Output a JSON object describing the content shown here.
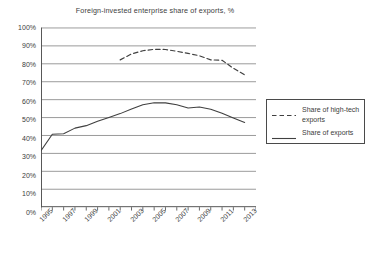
{
  "chart_data": {
    "type": "line",
    "title": "Foreign-invested enterprise share of exports, %",
    "xlabel": "",
    "ylabel": "",
    "ylim": [
      0,
      100
    ],
    "xlim": [
      1995,
      2014
    ],
    "grid": "horizontal",
    "legend_position": "right",
    "y_ticks": [
      "0%",
      "10%",
      "20%",
      "30%",
      "40%",
      "50%",
      "60%",
      "70%",
      "80%",
      "90%",
      "100%"
    ],
    "y_tick_values": [
      0,
      10,
      20,
      30,
      40,
      50,
      60,
      70,
      80,
      90,
      100
    ],
    "x_ticks": [
      "1995",
      "1997",
      "1999",
      "2001",
      "2003",
      "2005",
      "2007",
      "2009",
      "2011",
      "2013"
    ],
    "x_tick_values": [
      1995,
      1997,
      1999,
      2001,
      2003,
      2005,
      2007,
      2009,
      2011,
      2013
    ],
    "x": [
      1995,
      1996,
      1997,
      1998,
      1999,
      2000,
      2001,
      2002,
      2003,
      2004,
      2005,
      2006,
      2007,
      2008,
      2009,
      2010,
      2011,
      2012,
      2013
    ],
    "series": [
      {
        "name": "Share of high-tech exports",
        "style": "dashed",
        "color": "#404040",
        "x": [
          2002,
          2003,
          2004,
          2005,
          2006,
          2007,
          2008,
          2009,
          2010,
          2011,
          2012,
          2013
        ],
        "values": [
          82.2,
          85.5,
          87.3,
          88.1,
          88.0,
          87.0,
          85.8,
          84.5,
          82.2,
          82.0,
          77.5,
          73.8
        ]
      },
      {
        "name": "Share of exports",
        "style": "solid",
        "color": "#404040",
        "x": [
          1995,
          1996,
          1997,
          1998,
          1999,
          2000,
          2001,
          2002,
          2003,
          2004,
          2005,
          2006,
          2007,
          2008,
          2009,
          2010,
          2011,
          2012,
          2013
        ],
        "values": [
          31.5,
          40.7,
          41.0,
          44.1,
          45.5,
          47.9,
          50.1,
          52.2,
          54.8,
          57.1,
          58.3,
          58.2,
          57.1,
          55.3,
          55.9,
          54.6,
          52.4,
          49.8,
          47.3
        ]
      }
    ]
  },
  "legend": {
    "entries": [
      {
        "label": "Share of high-tech exports",
        "style": "dashed"
      },
      {
        "label": "Share of exports",
        "style": "solid"
      }
    ]
  }
}
